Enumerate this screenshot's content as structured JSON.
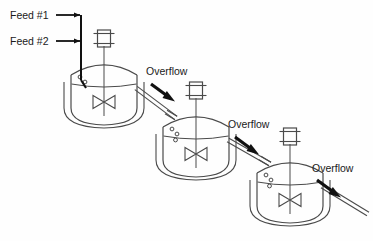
{
  "diagram": {
    "type": "process-flow-diagram",
    "background_color": "#fefefe",
    "line_color": "#4a4a4a",
    "arrow_color": "#111111",
    "text_color": "#1a1a1a"
  },
  "feeds": [
    {
      "id": "feed-1",
      "label": "Feed #1",
      "x": 10,
      "y": 19
    },
    {
      "id": "feed-2",
      "label": "Feed #2",
      "x": 10,
      "y": 45
    }
  ],
  "overflows": [
    {
      "id": "overflow-1",
      "label": "Overflow",
      "x": 146,
      "y": 75
    },
    {
      "id": "overflow-2",
      "label": "Overflow",
      "x": 228,
      "y": 128
    },
    {
      "id": "overflow-3",
      "label": "Overflow",
      "x": 312,
      "y": 172
    }
  ],
  "vessels": [
    {
      "id": "reactor-1",
      "name": "Reactor 1",
      "cx": 104,
      "top": 62,
      "rx": 33,
      "body_height": 46,
      "motor_y": 30,
      "droplets": 2
    },
    {
      "id": "reactor-2",
      "name": "Reactor 2",
      "cx": 196,
      "top": 114,
      "rx": 33,
      "body_height": 46,
      "motor_y": 82,
      "droplets": 3
    },
    {
      "id": "reactor-3",
      "name": "Reactor 3",
      "cx": 290,
      "top": 160,
      "rx": 33,
      "body_height": 46,
      "motor_y": 128,
      "droplets": 3
    }
  ],
  "components": {
    "motor": "agitator-motor-drive",
    "shaft": "agitator-shaft",
    "impeller": "bowtie-impeller",
    "jacket": "vessel-jacket",
    "level": "liquid-level-line",
    "pipe": "overflow-pipe",
    "feed_pipe": "feed-header-pipe"
  }
}
